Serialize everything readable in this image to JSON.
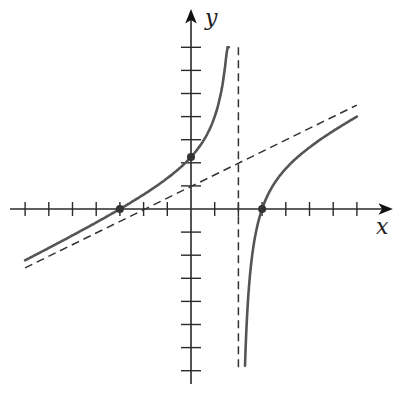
{
  "chart_data": {
    "type": "line",
    "title": "",
    "xlabel": "x",
    "ylabel": "y",
    "function": "f(x) = (x^2 - 9) / (2(x - 2))",
    "xlim": [
      -7,
      7
    ],
    "ylim": [
      -7,
      7
    ],
    "tick_step": 1,
    "grid": false,
    "ticks_x": [
      -7,
      -6,
      -5,
      -4,
      -3,
      -2,
      -1,
      1,
      2,
      3,
      4,
      5,
      6,
      7
    ],
    "ticks_y": [
      -7,
      -6,
      -5,
      -4,
      -3,
      -2,
      -1,
      1,
      2,
      3,
      4,
      5,
      6,
      7
    ],
    "vertical_asymptote": {
      "x": 2,
      "style": "dashed"
    },
    "slant_asymptote": {
      "equation": "y = x/2 + 1",
      "slope": 0.5,
      "intercept": 1,
      "style": "dashed"
    },
    "series": [
      {
        "name": "left branch",
        "x": [
          -7,
          -6,
          -5,
          -4,
          -3,
          -2,
          -1,
          0,
          0.5,
          1,
          1.3,
          1.5,
          1.6
        ],
        "y": [
          -2.22,
          -1.69,
          -1.14,
          -0.58,
          0,
          0.63,
          1.33,
          2.25,
          2.92,
          4.0,
          5.21,
          6.75,
          8.05
        ]
      },
      {
        "name": "right branch",
        "x": [
          2.28,
          2.4,
          2.6,
          3,
          3.5,
          4,
          5,
          6,
          7
        ],
        "y": [
          -6.8,
          -4.05,
          -1.87,
          0,
          1.08,
          1.75,
          2.67,
          3.38,
          4.0
        ]
      }
    ],
    "marked_points": [
      {
        "x": -3,
        "y": 0,
        "label": "x-intercept"
      },
      {
        "x": 3,
        "y": 0,
        "label": "x-intercept"
      },
      {
        "x": 0,
        "y": 2.25,
        "label": "y-intercept"
      }
    ]
  },
  "axes": {
    "x_label": "x",
    "y_label": "y"
  },
  "layout": {
    "origin_px": [
      191,
      209
    ],
    "unit_px_x": 23.7,
    "unit_px_y": 23.1
  }
}
